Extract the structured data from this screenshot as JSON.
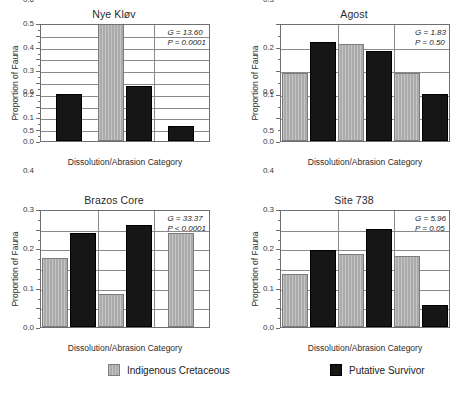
{
  "figure": {
    "xlabel": "Dissolution/Abrasion Category",
    "ylabel": "Proportion of Fauna",
    "categories": [
      "Susceptible",
      "Unaffected",
      "Resistant"
    ]
  },
  "legend": {
    "position": "bottom",
    "entries": [
      {
        "label": "Indigenous Cretaceous",
        "color": "#ababab",
        "key": "indigenous-cretaceous"
      },
      {
        "label": "Putative Survivor",
        "color": "#161616",
        "key": "putative-survivor"
      }
    ]
  },
  "chart_data": [
    {
      "type": "bar",
      "id": "nye-klov",
      "title": "Nye Kløv",
      "xlabel": "Dissolution/Abrasion Category",
      "ylabel": "Proportion of Fauna",
      "categories": [
        "Susceptible",
        "Unaffected",
        "Resistant"
      ],
      "ylim": [
        0.0,
        1.0
      ],
      "yticks": [
        0.0,
        0.1,
        0.2,
        0.3,
        0.4,
        0.5,
        0.6,
        0.7,
        0.8,
        0.9,
        1.0
      ],
      "ytick_labels": [
        "0.0",
        "0.1",
        "0.2",
        "0.3",
        "0.4",
        "0.5",
        "0.6",
        "0.7",
        "0.8",
        "0.9",
        "1.0"
      ],
      "grid": true,
      "series": [
        {
          "name": "Indigenous Cretaceous",
          "color": "#ababab",
          "values": [
            0.0,
            1.0,
            0.0
          ]
        },
        {
          "name": "Putative Survivor",
          "color": "#161616",
          "values": [
            0.4,
            0.47,
            0.13
          ]
        }
      ],
      "annotations": {
        "G": "G = 13.60",
        "P": "P = 0.0001"
      }
    },
    {
      "type": "bar",
      "id": "agost",
      "title": "Agost",
      "xlabel": "Dissolution/Abrasion Category",
      "ylabel": "Proportion of Fauna",
      "categories": [
        "Susceptible",
        "Unaffected",
        "Resistant"
      ],
      "ylim": [
        0.0,
        0.5
      ],
      "yticks": [
        0.0,
        0.1,
        0.2,
        0.3,
        0.4,
        0.5
      ],
      "ytick_labels": [
        "0.0",
        "0.1",
        "0.2",
        "0.3",
        "0.4",
        "0.5"
      ],
      "grid": true,
      "series": [
        {
          "name": "Indigenous Cretaceous",
          "color": "#ababab",
          "values": [
            0.29,
            0.41,
            0.29
          ]
        },
        {
          "name": "Putative Survivor",
          "color": "#161616",
          "values": [
            0.42,
            0.38,
            0.2
          ]
        }
      ],
      "annotations": {
        "G": "G = 1.83",
        "P": "P = 0.50"
      }
    },
    {
      "type": "bar",
      "id": "brazos-core",
      "title": "Brazos Core",
      "xlabel": "Dissolution/Abrasion Category",
      "ylabel": "Proportion of Fauna",
      "categories": [
        "Susceptible",
        "Unaffected",
        "Resistant"
      ],
      "ylim": [
        0.0,
        0.6
      ],
      "yticks": [
        0.0,
        0.1,
        0.2,
        0.3,
        0.4,
        0.5,
        0.6
      ],
      "ytick_labels": [
        "0.0",
        "0.1",
        "0.2",
        "0.3",
        "0.4",
        "0.5",
        "0.6"
      ],
      "grid": true,
      "series": [
        {
          "name": "Indigenous Cretaceous",
          "color": "#ababab",
          "values": [
            0.35,
            0.17,
            0.48
          ]
        },
        {
          "name": "Putative Survivor",
          "color": "#161616",
          "values": [
            0.48,
            0.52,
            0.0
          ]
        }
      ],
      "annotations": {
        "G": "G = 33.37",
        "P": "P < 0.0001"
      }
    },
    {
      "type": "bar",
      "id": "site-738",
      "title": "Site 738",
      "xlabel": "Dissolution/Abrasion Category",
      "ylabel": "Proportion of Fauna",
      "categories": [
        "Susceptible",
        "Unaffected",
        "Resistant"
      ],
      "ylim": [
        0.0,
        0.6
      ],
      "yticks": [
        0.0,
        0.1,
        0.2,
        0.3,
        0.4,
        0.5,
        0.6
      ],
      "ytick_labels": [
        "0.0",
        "0.1",
        "0.2",
        "0.3",
        "0.4",
        "0.5",
        "0.6"
      ],
      "grid": true,
      "series": [
        {
          "name": "Indigenous Cretaceous",
          "color": "#ababab",
          "values": [
            0.27,
            0.37,
            0.36
          ]
        },
        {
          "name": "Putative Survivor",
          "color": "#161616",
          "values": [
            0.39,
            0.5,
            0.11
          ]
        }
      ],
      "annotations": {
        "G": "G = 5.96",
        "P": "P = 0.05"
      }
    }
  ]
}
